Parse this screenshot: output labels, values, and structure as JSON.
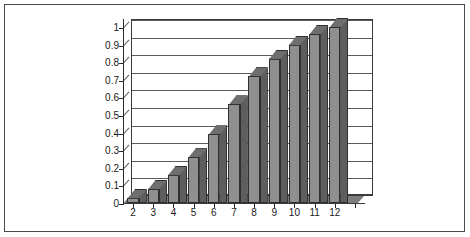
{
  "chart_data": {
    "type": "bar",
    "title": "",
    "subtitle": "",
    "xlabel": "",
    "ylabel": "",
    "categories": [
      "2",
      "3",
      "4",
      "5",
      "6",
      "7",
      "8",
      "9",
      "10",
      "11",
      "12"
    ],
    "values": [
      0.03,
      0.08,
      0.16,
      0.26,
      0.39,
      0.56,
      0.72,
      0.82,
      0.9,
      0.96,
      1.0
    ],
    "series": [
      {
        "name": "",
        "values": [
          0.03,
          0.08,
          0.16,
          0.26,
          0.39,
          0.56,
          0.72,
          0.82,
          0.9,
          0.96,
          1.0
        ]
      }
    ],
    "ylim": [
      0,
      1
    ],
    "xlim_categories": 12,
    "y_ticks": [
      0,
      0.1,
      0.2,
      0.3,
      0.4,
      0.5,
      0.6,
      0.7,
      0.8,
      0.9,
      1
    ],
    "y_tick_labels": [
      "0",
      "0.1",
      "0.2",
      "0.3",
      "0.4",
      "0.5",
      "0.6",
      "0.7",
      "0.8",
      "0.9",
      "1"
    ],
    "grid": true,
    "grid_axis": "y",
    "legend": false,
    "legend_position": "none",
    "style": "3d-column",
    "empty_trailing_slots": 1,
    "colors": {
      "bar_front": "#8f8f8f",
      "bar_side": "#5e5e5e",
      "bar_top": "#6e6e6e",
      "bar_outline": "#2f2f2f",
      "gridline": "#5a5a5a",
      "axis": "#2b2b2b",
      "floor": "#7d7d7d",
      "frame_border": "#4a4a4a",
      "plot_background": "#ffffff",
      "text": "#1a1a1a"
    }
  }
}
